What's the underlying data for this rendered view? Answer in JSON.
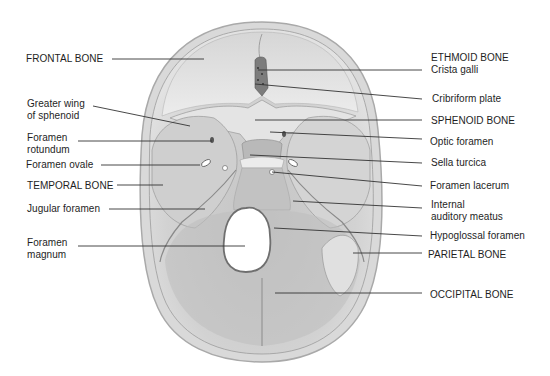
{
  "diagram": {
    "colors": {
      "background": "#ffffff",
      "bone_light": "#e6e6e6",
      "bone_mid": "#c9c9c9",
      "bone_dark": "#a7a7a7",
      "rim": "#b8b8b8",
      "leader_line": "#333333",
      "text": "#1e1e1e"
    },
    "labels_left": [
      {
        "id": "frontal-bone",
        "text": "FRONTAL BONE",
        "x": 26,
        "y": 53,
        "line": {
          "x1": 112,
          "y1": 59,
          "x2": 204,
          "y2": 59
        }
      },
      {
        "id": "greater-wing-sphenoid",
        "text": "Greater wing\nof sphenoid",
        "x": 27,
        "y": 98,
        "line": {
          "x1": 93,
          "y1": 106,
          "x2": 190,
          "y2": 126
        }
      },
      {
        "id": "foramen-rotundum",
        "text": "Foramen\nrotundum",
        "x": 27,
        "y": 132,
        "line": {
          "x1": 78,
          "y1": 141,
          "x2": 212,
          "y2": 141
        }
      },
      {
        "id": "foramen-ovale",
        "text": "Foramen ovale",
        "x": 26,
        "y": 159,
        "line": {
          "x1": 101,
          "y1": 165,
          "x2": 200,
          "y2": 165
        }
      },
      {
        "id": "temporal-bone",
        "text": "TEMPORAL BONE",
        "x": 27,
        "y": 180,
        "line": {
          "x1": 117,
          "y1": 185,
          "x2": 163,
          "y2": 185
        }
      },
      {
        "id": "jugular-foramen",
        "text": "Jugular foramen",
        "x": 27,
        "y": 203,
        "line": {
          "x1": 109,
          "y1": 209,
          "x2": 205,
          "y2": 209
        }
      },
      {
        "id": "foramen-magnum",
        "text": "Foramen\nmagnum",
        "x": 27,
        "y": 237,
        "line": {
          "x1": 78,
          "y1": 246,
          "x2": 245,
          "y2": 246
        }
      }
    ],
    "labels_right": [
      {
        "id": "ethmoid-bone-crista-galli",
        "text": "ETHMOID BONE\nCrista galli",
        "x": 431,
        "y": 52,
        "line": {
          "x1": 258,
          "y1": 70,
          "x2": 422,
          "y2": 70
        }
      },
      {
        "id": "cribriform-plate",
        "text": "Cribriform plate",
        "x": 432,
        "y": 93,
        "line": {
          "x1": 255,
          "y1": 84,
          "x2": 422,
          "y2": 99
        }
      },
      {
        "id": "sphenoid-bone",
        "text": "SPHENOID BONE",
        "x": 431,
        "y": 115,
        "line": {
          "x1": 255,
          "y1": 120,
          "x2": 422,
          "y2": 120
        }
      },
      {
        "id": "optic-foramen",
        "text": "Optic foramen",
        "x": 430,
        "y": 136,
        "line": {
          "x1": 270,
          "y1": 132,
          "x2": 422,
          "y2": 139
        }
      },
      {
        "id": "sella-turcica",
        "text": "Sella turcica",
        "x": 431,
        "y": 157,
        "line": {
          "x1": 250,
          "y1": 155,
          "x2": 422,
          "y2": 163
        }
      },
      {
        "id": "foramen-lacerum",
        "text": "Foramen lacerum",
        "x": 430,
        "y": 180,
        "line": {
          "x1": 272,
          "y1": 172,
          "x2": 422,
          "y2": 186
        }
      },
      {
        "id": "internal-auditory-meatus",
        "text": "Internal\nauditory meatus",
        "x": 431,
        "y": 199,
        "line": {
          "x1": 293,
          "y1": 201,
          "x2": 422,
          "y2": 208
        }
      },
      {
        "id": "hypoglossal-foramen",
        "text": "Hypoglossal foramen",
        "x": 430,
        "y": 230,
        "line": {
          "x1": 274,
          "y1": 228,
          "x2": 422,
          "y2": 236
        }
      },
      {
        "id": "parietal-bone",
        "text": "PARIETAL BONE",
        "x": 428,
        "y": 249,
        "line": {
          "x1": 353,
          "y1": 253,
          "x2": 422,
          "y2": 253
        }
      },
      {
        "id": "occipital-bone",
        "text": "OCCIPITAL BONE",
        "x": 430,
        "y": 289,
        "line": {
          "x1": 275,
          "y1": 293,
          "x2": 422,
          "y2": 293
        }
      }
    ]
  }
}
